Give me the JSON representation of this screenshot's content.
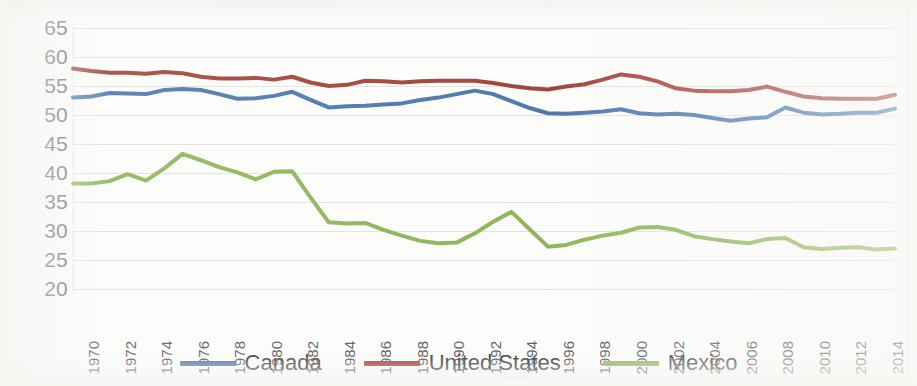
{
  "chart_data": {
    "type": "line",
    "title": "",
    "xlabel": "",
    "ylabel": "",
    "ylim": [
      20,
      65
    ],
    "ytick_step": 5,
    "yticks": [
      65,
      60,
      55,
      50,
      45,
      40,
      35,
      30,
      25,
      20
    ],
    "grid": true,
    "legend_position": "bottom",
    "x": [
      1970,
      1971,
      1972,
      1973,
      1974,
      1975,
      1976,
      1977,
      1978,
      1979,
      1980,
      1981,
      1982,
      1983,
      1984,
      1985,
      1986,
      1987,
      1988,
      1989,
      1990,
      1991,
      1992,
      1993,
      1994,
      1995,
      1996,
      1997,
      1998,
      1999,
      2000,
      2001,
      2002,
      2003,
      2004,
      2005,
      2006,
      2007,
      2008,
      2009,
      2010,
      2011,
      2012,
      2013,
      2014,
      2015
    ],
    "xtick_labels": [
      "1970",
      "1972",
      "1974",
      "1976",
      "1978",
      "1980",
      "1982",
      "1984",
      "1986",
      "1988",
      "1990",
      "1992",
      "1994",
      "1996",
      "1998",
      "2000",
      "2002",
      "2004",
      "2006",
      "2008",
      "2010",
      "2012",
      "2014"
    ],
    "xtick_values": [
      1970,
      1972,
      1974,
      1976,
      1978,
      1980,
      1982,
      1984,
      1986,
      1988,
      1990,
      1992,
      1994,
      1996,
      1998,
      2000,
      2002,
      2004,
      2006,
      2008,
      2010,
      2012,
      2014
    ],
    "series": [
      {
        "name": "Canada",
        "color": "#4472a8",
        "values": [
          53.0,
          53.2,
          53.8,
          53.7,
          53.6,
          54.3,
          54.5,
          54.3,
          53.6,
          52.8,
          52.9,
          53.3,
          54.0,
          52.6,
          51.3,
          51.5,
          51.6,
          51.8,
          52.0,
          52.6,
          53.0,
          53.6,
          54.2,
          53.6,
          52.4,
          51.2,
          50.3,
          50.2,
          50.4,
          50.6,
          51.0,
          50.3,
          50.1,
          50.2,
          50.0,
          49.5,
          49.0,
          49.4,
          49.6,
          51.3,
          50.4,
          50.1,
          50.2,
          50.4,
          50.4,
          51.1
        ]
      },
      {
        "name": "United States",
        "color": "#9e3b32",
        "values": [
          58.0,
          57.6,
          57.3,
          57.3,
          57.1,
          57.4,
          57.2,
          56.6,
          56.3,
          56.3,
          56.4,
          56.1,
          56.6,
          55.6,
          55.0,
          55.2,
          55.9,
          55.8,
          55.6,
          55.8,
          55.9,
          55.9,
          55.9,
          55.5,
          55.0,
          54.6,
          54.4,
          54.9,
          55.3,
          56.1,
          57.0,
          56.6,
          55.8,
          54.6,
          54.2,
          54.1,
          54.1,
          54.3,
          54.9,
          54.0,
          53.2,
          52.9,
          52.8,
          52.8,
          52.8,
          53.5
        ]
      },
      {
        "name": "Mexico",
        "color": "#8ab14f",
        "values": [
          38.2,
          38.2,
          38.6,
          39.8,
          38.7,
          40.8,
          43.3,
          42.2,
          41.0,
          40.1,
          38.9,
          40.2,
          40.3,
          35.8,
          31.5,
          31.3,
          31.4,
          30.2,
          29.2,
          28.3,
          27.9,
          28.0,
          29.6,
          31.6,
          33.3,
          30.3,
          27.3,
          27.6,
          28.5,
          29.2,
          29.7,
          30.6,
          30.7,
          30.2,
          29.1,
          28.6,
          28.2,
          27.9,
          28.6,
          28.8,
          27.2,
          26.9,
          27.1,
          27.2,
          26.8,
          27.0
        ]
      }
    ]
  },
  "legend": {
    "items": [
      {
        "label": "Canada",
        "color": "#4472a8"
      },
      {
        "label": "United States",
        "color": "#9e3b32"
      },
      {
        "label": "Mexico",
        "color": "#8ab14f"
      }
    ]
  }
}
